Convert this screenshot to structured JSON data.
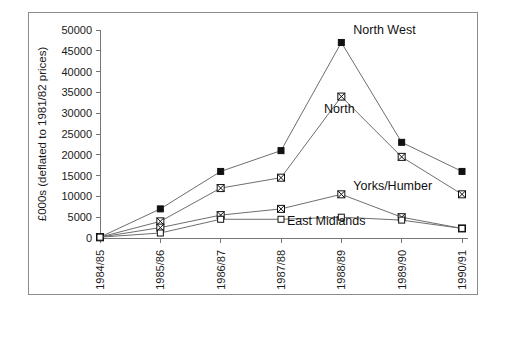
{
  "chart_data": {
    "type": "line",
    "title": "",
    "subtitle": "",
    "xlabel": "",
    "ylabel": "£000s (deflated to 1981/82 prices)",
    "categories": [
      "1984/85",
      "1985/86",
      "1986/87",
      "1987/88",
      "1988/89",
      "1989/90",
      "1990/91"
    ],
    "ylim": [
      0,
      50000
    ],
    "ytick_step": 5000,
    "yticks": [
      0,
      5000,
      10000,
      15000,
      20000,
      25000,
      30000,
      35000,
      40000,
      45000,
      50000
    ],
    "ytick_labels": [
      "0",
      "5000",
      "10000",
      "15000",
      "20000",
      "25000",
      "30000",
      "35000",
      "40000",
      "45000",
      "50000"
    ],
    "grid": false,
    "legend_position": "inline-annotations",
    "xtick_label_rotation": -90,
    "series": [
      {
        "name": "North West",
        "label": "North West",
        "marker": "filled-square",
        "values": [
          200,
          7000,
          16000,
          21000,
          47000,
          23000,
          16000
        ]
      },
      {
        "name": "North",
        "label": "North",
        "marker": "cross-square",
        "values": [
          200,
          4000,
          12000,
          14500,
          34000,
          19500,
          10500
        ]
      },
      {
        "name": "Yorks/Humber",
        "label": "Yorks/Humber",
        "marker": "cross-square",
        "values": [
          200,
          2500,
          5500,
          7000,
          10500,
          5000,
          2300
        ]
      },
      {
        "name": "East Midlands",
        "label": "East Midlands",
        "marker": "open-square",
        "values": [
          200,
          1200,
          4500,
          4500,
          5000,
          4300,
          2300
        ]
      }
    ],
    "annotations": [
      {
        "text": "North West",
        "series": "North West",
        "at_category": "1988/89"
      },
      {
        "text": "North",
        "series": "North",
        "at_category": "1988/89"
      },
      {
        "text": "Yorks/Humber",
        "series": "Yorks/Humber",
        "at_category": "1988/89"
      },
      {
        "text": "East Midlands",
        "series": "East Midlands",
        "at_category": "1987/88"
      }
    ],
    "colors": {
      "line": "#6e6e6e",
      "marker": "#111111",
      "axis": "#767676",
      "text": "#1a1a1a",
      "frame": "#8c8c8c",
      "background": "#ffffff"
    }
  }
}
